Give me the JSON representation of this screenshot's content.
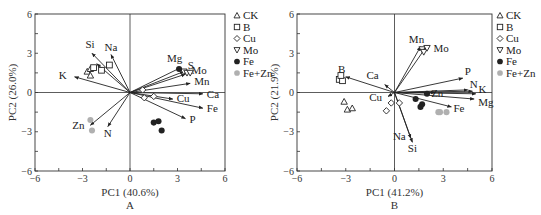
{
  "chart_data": [
    {
      "type": "scatter",
      "subtype": "pca-biplot",
      "panel_label": "A",
      "xlabel": "PC1 (40.6%)",
      "ylabel": "PC2 (26.0%)",
      "xlim": [
        -6,
        6
      ],
      "ylim": [
        -6,
        6
      ],
      "xticks": [
        -6,
        -3,
        0,
        3,
        6
      ],
      "yticks": [
        -6,
        -3,
        0,
        3,
        6
      ],
      "grid": false,
      "legend_position": "right",
      "loadings": [
        {
          "name": "Na",
          "x": -1.2,
          "y": 2.9
        },
        {
          "name": "Si",
          "x": -2.4,
          "y": 3.0
        },
        {
          "name": "K",
          "x": -3.5,
          "y": 1.2
        },
        {
          "name": "B",
          "x": -2.1,
          "y": 2.2
        },
        {
          "name": "Zn",
          "x": -2.5,
          "y": -2.5
        },
        {
          "name": "N",
          "x": -1.4,
          "y": -2.6
        },
        {
          "name": "Mg",
          "x": 3.2,
          "y": 1.9
        },
        {
          "name": "S",
          "x": 3.4,
          "y": 1.6
        },
        {
          "name": "Mo",
          "x": 3.5,
          "y": 1.4
        },
        {
          "name": "Mn",
          "x": 3.8,
          "y": 0.7
        },
        {
          "name": "Ca",
          "x": 4.6,
          "y": -0.1
        },
        {
          "name": "Cu",
          "x": 2.7,
          "y": -0.5
        },
        {
          "name": "Fe",
          "x": 4.6,
          "y": -1.2
        },
        {
          "name": "P",
          "x": 3.5,
          "y": -2.0
        }
      ],
      "series": [
        {
          "name": "CK",
          "marker": "triangle-up",
          "points": [
            [
              -2.7,
              1.6
            ],
            [
              -2.5,
              1.8
            ],
            [
              -2.5,
              1.3
            ]
          ]
        },
        {
          "name": "B",
          "marker": "square",
          "points": [
            [
              -1.3,
              2.1
            ],
            [
              -1.8,
              1.7
            ],
            [
              -2.3,
              1.9
            ]
          ]
        },
        {
          "name": "Cu",
          "marker": "diamond",
          "points": [
            [
              0.9,
              -0.4
            ],
            [
              1.5,
              -0.3
            ],
            [
              0.8,
              0.2
            ]
          ]
        },
        {
          "name": "Mo",
          "marker": "triangle-down",
          "points": [
            [
              3.4,
              1.6
            ],
            [
              3.6,
              1.5
            ],
            [
              3.8,
              1.5
            ]
          ]
        },
        {
          "name": "Fe",
          "marker": "filled-circle",
          "points": [
            [
              1.5,
              -2.3
            ],
            [
              1.8,
              -2.2
            ],
            [
              2.0,
              -2.9
            ],
            [
              3.1,
              1.8
            ]
          ]
        },
        {
          "name": "Fe+Zn",
          "marker": "gray-circle",
          "points": [
            [
              -2.5,
              -2.1
            ],
            [
              -2.4,
              -2.9
            ]
          ]
        }
      ]
    },
    {
      "type": "scatter",
      "subtype": "pca-biplot",
      "panel_label": "B",
      "xlabel": "PC1 (41.2%)",
      "ylabel": "PC2 (21.9%)",
      "xlim": [
        -6,
        6
      ],
      "ylim": [
        -6,
        6
      ],
      "xticks": [
        -6,
        -3,
        0,
        3,
        6
      ],
      "yticks": [
        -6,
        -3,
        0,
        3,
        6
      ],
      "grid": false,
      "legend_position": "right",
      "loadings": [
        {
          "name": "Mn",
          "x": 1.6,
          "y": 3.5
        },
        {
          "name": "Mo",
          "x": 1.9,
          "y": 3.4
        },
        {
          "name": "B",
          "x": -3.0,
          "y": 1.2
        },
        {
          "name": "Ca",
          "x": -0.6,
          "y": 0.6
        },
        {
          "name": "Cu",
          "x": -0.4,
          "y": -0.3
        },
        {
          "name": "P",
          "x": 4.2,
          "y": 1.1
        },
        {
          "name": "N",
          "x": 4.5,
          "y": 0.2
        },
        {
          "name": "K",
          "x": 4.8,
          "y": 0.1
        },
        {
          "name": "S",
          "x": 5.0,
          "y": -0.1
        },
        {
          "name": "Mg",
          "x": 4.9,
          "y": -0.5
        },
        {
          "name": "Zn",
          "x": 2.5,
          "y": 0.0
        },
        {
          "name": "Fe",
          "x": 3.5,
          "y": -1.1
        },
        {
          "name": "Na",
          "x": 1.0,
          "y": -3.5
        },
        {
          "name": "Si",
          "x": 1.1,
          "y": -3.8
        }
      ],
      "series": [
        {
          "name": "CK",
          "marker": "triangle-up",
          "points": [
            [
              -3.1,
              -0.7
            ],
            [
              -2.9,
              -1.3
            ],
            [
              -2.6,
              -1.2
            ]
          ]
        },
        {
          "name": "B",
          "marker": "square",
          "points": [
            [
              -3.4,
              1.0
            ],
            [
              -3.2,
              0.9
            ],
            [
              -3.3,
              1.3
            ]
          ]
        },
        {
          "name": "Cu",
          "marker": "diamond",
          "points": [
            [
              -0.2,
              -0.8
            ],
            [
              0.3,
              -0.8
            ],
            [
              -0.5,
              -1.4
            ]
          ]
        },
        {
          "name": "Mo",
          "marker": "triangle-down",
          "points": [
            [
              1.7,
              3.3
            ],
            [
              1.8,
              3.1
            ],
            [
              2.0,
              3.4
            ]
          ]
        },
        {
          "name": "Fe",
          "marker": "filled-circle",
          "points": [
            [
              1.3,
              -0.5
            ],
            [
              1.7,
              -0.9
            ],
            [
              1.6,
              -1.1
            ],
            [
              2.0,
              -0.1
            ]
          ]
        },
        {
          "name": "Fe+Zn",
          "marker": "gray-circle",
          "points": [
            [
              2.8,
              -1.5
            ],
            [
              3.2,
              -1.5
            ],
            [
              2.7,
              -1.5
            ]
          ]
        }
      ]
    }
  ],
  "panels": [
    {
      "label": "A",
      "xlabel": "PC1 (40.6%)",
      "ylabel": "PC2 (26.0%)",
      "xticks": [
        "−6",
        "−3",
        "0",
        "3",
        "6"
      ],
      "yticks": [
        "6",
        "3",
        "0",
        "−3",
        "−6"
      ]
    },
    {
      "label": "B",
      "xlabel": "PC1 (41.2%)",
      "ylabel": "PC2 (21.9%)",
      "xticks": [
        "−6",
        "−3",
        "0",
        "3",
        "6"
      ],
      "yticks": [
        "6",
        "3",
        "0",
        "−3",
        "−6"
      ]
    }
  ],
  "legend": [
    {
      "label": "CK",
      "marker": "triangle-up"
    },
    {
      "label": "B",
      "marker": "square"
    },
    {
      "label": "Cu",
      "marker": "diamond"
    },
    {
      "label": "Mo",
      "marker": "triangle-down"
    },
    {
      "label": "Fe",
      "marker": "filled-circle"
    },
    {
      "label": "Fe+Zn",
      "marker": "gray-circle"
    }
  ],
  "colors": {
    "axis": "#333333",
    "arrow": "#222222",
    "fe": "#222222",
    "fezn": "#b0b0b0"
  }
}
